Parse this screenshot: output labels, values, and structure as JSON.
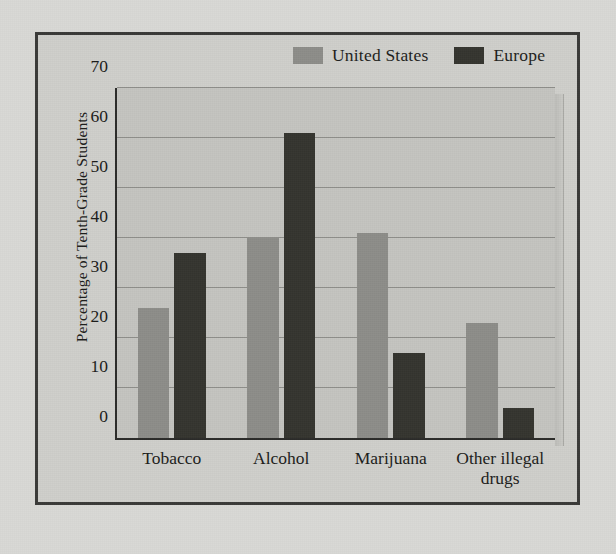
{
  "chart_data": {
    "type": "bar",
    "title": "",
    "xlabel": "",
    "ylabel": "Percentage of Tenth-Grade Students",
    "categories": [
      "Tobacco",
      "Alcohol",
      "Marijuana",
      "Other illegal\ndrugs"
    ],
    "series": [
      {
        "name": "United States",
        "color": "#8d8d89",
        "values": [
          26,
          40,
          41,
          23
        ]
      },
      {
        "name": "Europe",
        "color": "#35352f",
        "values": [
          37,
          61,
          17,
          6
        ]
      }
    ],
    "ylim": [
      0,
      70
    ],
    "yticks": [
      0,
      10,
      20,
      30,
      40,
      50,
      60,
      70
    ],
    "ytick_labels": [
      "0",
      "10",
      "20",
      "30",
      "40",
      "50",
      "60",
      "70"
    ],
    "grid": true,
    "legend_position": "top-right"
  }
}
